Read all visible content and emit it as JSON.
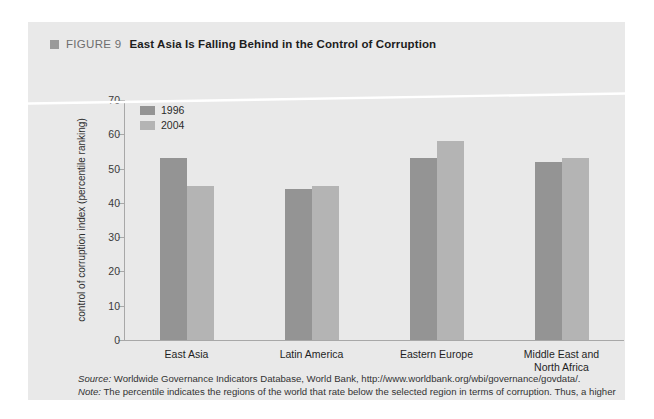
{
  "figure": {
    "marker_icon": "square-marker-icon",
    "number": "FIGURE 9",
    "title": "East Asia Is Falling Behind in the Control of Corruption"
  },
  "legend": {
    "items": [
      {
        "label": "1996",
        "color": "#949494"
      },
      {
        "label": "2004",
        "color": "#b4b4b4"
      }
    ]
  },
  "notes": {
    "source_lead": "Source:",
    "source_text": " Worldwide Governance Indicators Database, World Bank, http://www.worldbank.org/wbi/governance/govdata/.",
    "note_lead": "Note:",
    "note_text": " The percentile indicates the regions of the world that rate below the selected region in terms of corruption. Thus, a higher percentile shows better performance in the control of corruption."
  },
  "chart_data": {
    "type": "bar",
    "title": "East Asia Is Falling Behind in the Control of Corruption",
    "xlabel": "",
    "ylabel": "control of corruption index (percentile ranking)",
    "ylim": [
      0,
      70
    ],
    "yticks": [
      0,
      10,
      20,
      30,
      40,
      50,
      60,
      70
    ],
    "grid": false,
    "legend_position": "top-left",
    "categories": [
      "East Asia",
      "Latin America",
      "Eastern Europe",
      "Middle East and North Africa"
    ],
    "category_lines": [
      [
        "East Asia"
      ],
      [
        "Latin America"
      ],
      [
        "Eastern Europe"
      ],
      [
        "Middle East and",
        "North Africa"
      ]
    ],
    "series": [
      {
        "name": "1996",
        "color": "#949494",
        "values": [
          53,
          44,
          53,
          52
        ]
      },
      {
        "name": "2004",
        "color": "#b4b4b4",
        "values": [
          45,
          45,
          58,
          53
        ]
      }
    ]
  }
}
